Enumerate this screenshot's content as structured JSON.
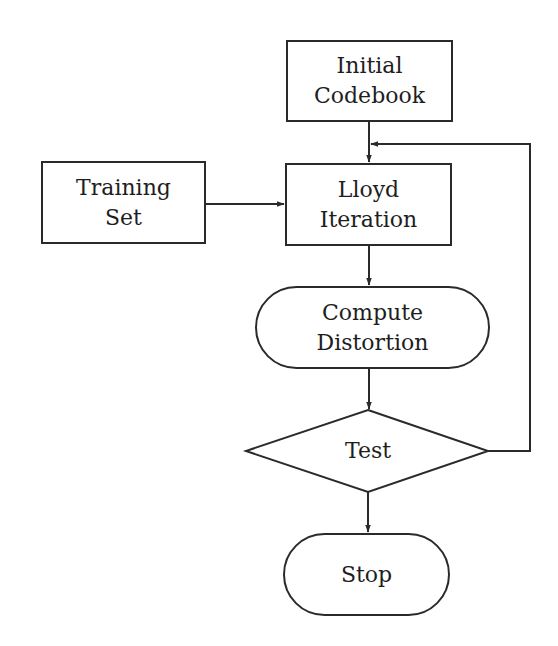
{
  "diagram": {
    "type": "flowchart",
    "colors": {
      "stroke": "#2a2a2a",
      "text": "#1e1e1e",
      "background": "#ffffff"
    },
    "nodes": {
      "initial_codebook": {
        "shape": "rectangle",
        "line1": "Initial",
        "line2": "Codebook"
      },
      "training_set": {
        "shape": "rectangle",
        "line1": "Training",
        "line2": "Set"
      },
      "lloyd_iteration": {
        "shape": "rectangle",
        "line1": "Lloyd",
        "line2": "Iteration"
      },
      "compute_distortion": {
        "shape": "stadium",
        "line1": "Compute",
        "line2": "Distortion"
      },
      "test": {
        "shape": "diamond",
        "label": "Test"
      },
      "stop": {
        "shape": "stadium",
        "label": "Stop"
      }
    },
    "edges": [
      {
        "from": "Initial Codebook",
        "to": "Lloyd Iteration"
      },
      {
        "from": "Training Set",
        "to": "Lloyd Iteration"
      },
      {
        "from": "Lloyd Iteration",
        "to": "Compute Distortion"
      },
      {
        "from": "Compute Distortion",
        "to": "Test"
      },
      {
        "from": "Test",
        "to": "Lloyd Iteration",
        "note": "feedback loop"
      },
      {
        "from": "Test",
        "to": "Stop"
      }
    ]
  }
}
